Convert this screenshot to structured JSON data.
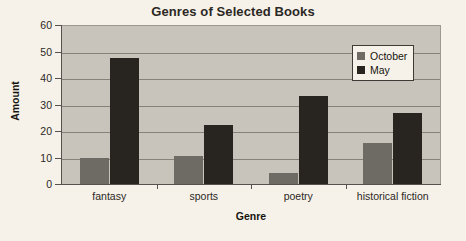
{
  "chart_data": {
    "type": "bar",
    "title": "Genres of Selected Books",
    "xlabel": "Genre",
    "ylabel": "Amount",
    "categories": [
      "fantasy",
      "sports",
      "poetry",
      "historical fiction"
    ],
    "series": [
      {
        "name": "October",
        "color": "#6e6b64",
        "values": [
          10,
          11,
          4.5,
          16
        ]
      },
      {
        "name": "May",
        "color": "#282420",
        "values": [
          48,
          22.5,
          33.5,
          27
        ]
      }
    ],
    "ylim": [
      0,
      60
    ],
    "y_ticks": [
      0,
      10,
      20,
      30,
      40,
      50,
      60
    ],
    "y_tick_labels": [
      "0",
      "10",
      "20",
      "30",
      "40",
      "50",
      "60"
    ],
    "grid": true,
    "legend_position": "top-right-inside",
    "plot_background": "#c8c4bc",
    "page_background": "#f6f2e9",
    "gridline_color": "#85817b"
  }
}
